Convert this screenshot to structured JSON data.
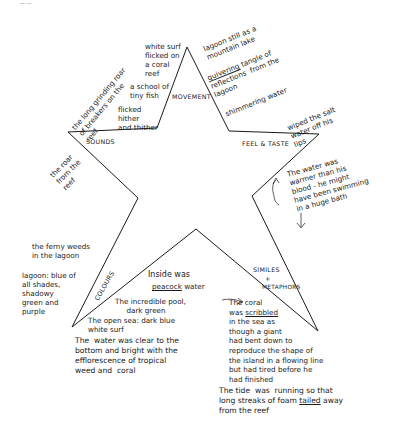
{
  "page_mark": "— —",
  "star": {
    "points": "187,47 229,131 319,134 252,196 318,331 196,229 72,327 138,198 68,132 157,128",
    "stroke": "#1a1a1a"
  },
  "categories": {
    "movement": "MOVEMENT",
    "feel_taste": "FEEL & TASTE",
    "sounds": "SOUNDS",
    "colours": "COLOURS",
    "similes_line1": "SIMILES",
    "similes_line2": "+",
    "similes_line3": "METAPHORS"
  },
  "notes": {
    "white_surf": "white surf\nflicked on\na coral\nreef",
    "school_fish": "a school of\ntiny fish",
    "flicked": "flicked\nhither\nand thither",
    "long_grinding_roar": "the long grinding roar\nof breakers on the\nreef",
    "lagoon_still": "lagoon still as a\nmountain lake",
    "quivering_word": "quivering",
    "quivering_rest": " tangle of\nreflections  from the\nlagoon",
    "shimmering": "shimmering water",
    "wiped_salt": "wiped the salt\nwater off his\nlips",
    "roar_from_reef": "the roar\nfrom the\nreef",
    "water_warmer": "The water was\nwarmer than his\nblood - he might\nhave been swimming\nin a huge bath",
    "ferny_weeds": "the ferny weeds\nin the lagoon",
    "lagoon_blue": "lagoon: blue of\nall shades,\nshadowy\ngreen and\npurple",
    "inside_was": "Inside was",
    "peacock_word": "peacock",
    "peacock_rest": " water",
    "incredible_pool": "The incredible pool,\n     dark green",
    "open_sea": "The open sea: dark blue\nwhite surf",
    "water_clear": "The  water was clear to the\nbottom and bright with the\nefflorescence of tropical\nweed and  coral",
    "coral_line1": "The coral",
    "coral_was": "was ",
    "coral_scribbled": "scribbled",
    "coral_rest": "in the sea as\nthough a giant\nhad bent down to\nreproduce the shape of\nthe island in a flowing line\nbut had tired before he\nhad finished",
    "tide_line1": "The tide  was  running so that",
    "tide_line2_a": "long streaks of foam ",
    "tide_line2_word": "tailed",
    "tide_line2_b": " away",
    "tide_line3": "from the reef"
  },
  "arrows": {
    "peacock_arrow": "→",
    "warmer_arrow": "↓"
  }
}
